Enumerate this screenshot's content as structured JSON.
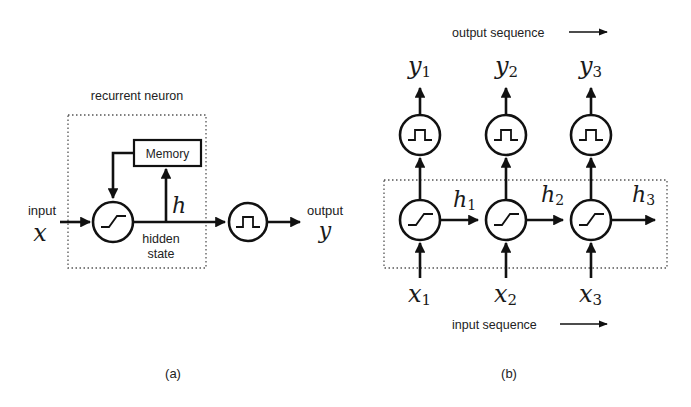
{
  "panel_a": {
    "caption": "(a)",
    "container_label": "recurrent neuron",
    "memory_label": "Memory",
    "input_label": "input",
    "input_var": "x",
    "hidden_var": "h",
    "hidden_label_line1": "hidden",
    "hidden_label_line2": "state",
    "output_label": "output",
    "output_var": "y",
    "nodes": [
      {
        "id": "hidden-activation",
        "icon": "sigmoid-icon"
      },
      {
        "id": "output-activation",
        "icon": "pulse-icon"
      }
    ]
  },
  "panel_b": {
    "caption": "(b)",
    "output_sequence_label": "output sequence",
    "input_sequence_label": "input sequence",
    "steps": [
      {
        "y": "y",
        "y_sub": "1",
        "h": "h",
        "h_sub": "1",
        "x": "x",
        "x_sub": "1"
      },
      {
        "y": "y",
        "y_sub": "2",
        "h": "h",
        "h_sub": "2",
        "x": "x",
        "x_sub": "2"
      },
      {
        "y": "y",
        "y_sub": "3",
        "h": "h",
        "h_sub": "3",
        "x": "x",
        "x_sub": "3"
      }
    ]
  },
  "colors": {
    "stroke": "#111111",
    "dashed_border": "#555555",
    "background": "#ffffff"
  }
}
